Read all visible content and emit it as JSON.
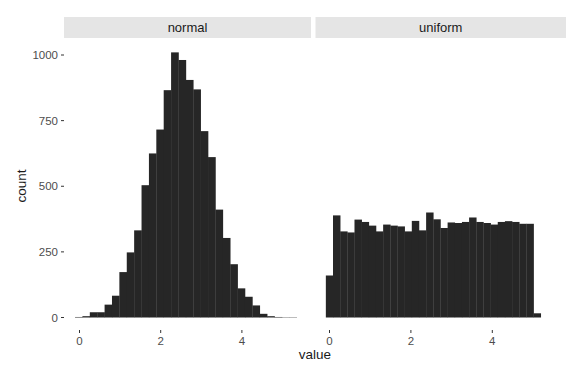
{
  "chart_data": {
    "type": "bar",
    "subtype": "faceted-histogram",
    "title": "",
    "xlabel": "value",
    "ylabel": "count",
    "ylim": [
      0,
      1050
    ],
    "yticks": [
      0,
      250,
      500,
      750,
      1000
    ],
    "xticks": [
      0,
      2,
      4
    ],
    "grid": false,
    "legend": null,
    "bins": 30,
    "facets": [
      {
        "name": "normal",
        "x_start": -0.11,
        "binwidth": 0.182,
        "values": [
          2,
          5,
          20,
          20,
          49,
          83,
          173,
          248,
          332,
          504,
          625,
          716,
          866,
          1010,
          981,
          905,
          869,
          710,
          611,
          411,
          303,
          203,
          111,
          79,
          46,
          14,
          5,
          2,
          1,
          1
        ]
      },
      {
        "name": "uniform",
        "x_start": -0.09,
        "binwidth": 0.176,
        "values": [
          160,
          389,
          328,
          324,
          373,
          364,
          350,
          328,
          354,
          350,
          347,
          328,
          368,
          332,
          400,
          374,
          341,
          362,
          360,
          364,
          381,
          364,
          360,
          354,
          364,
          367,
          364,
          357,
          357,
          16
        ]
      }
    ]
  },
  "colors": {
    "bar": "#262626",
    "strip_bg": "#e5e5e5",
    "panel_bg": "#ffffff",
    "tick": "#333333"
  }
}
